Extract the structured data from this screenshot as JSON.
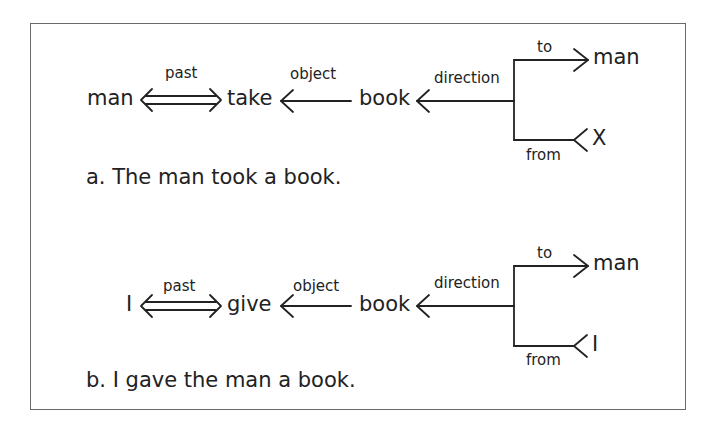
{
  "figure": {
    "diagrams": [
      {
        "id": "a",
        "nodes": {
          "agent": "man",
          "verb": "take",
          "object": "book",
          "to_target": "man",
          "from_source": "X"
        },
        "edges": {
          "tense": "past",
          "object": "object",
          "direction": "direction",
          "to": "to",
          "from": "from"
        },
        "caption": "a. The man took a book."
      },
      {
        "id": "b",
        "nodes": {
          "agent": "I",
          "verb": "give",
          "object": "book",
          "to_target": "man",
          "from_source": "I"
        },
        "edges": {
          "tense": "past",
          "object": "object",
          "direction": "direction",
          "to": "to",
          "from": "from"
        },
        "caption": "b. I gave the man a book."
      }
    ]
  },
  "colors": {
    "ink": "#222222",
    "frame": "#6a6a6a",
    "background": "#ffffff"
  }
}
